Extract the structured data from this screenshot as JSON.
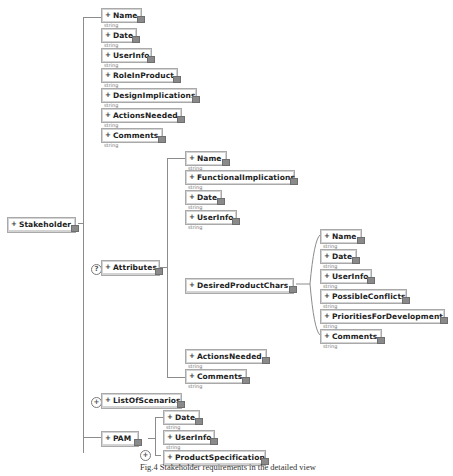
{
  "diagram": {
    "root": {
      "label": "Stakeholder"
    },
    "stakeholder_children": [
      {
        "label": "Name",
        "type": "string"
      },
      {
        "label": "Date",
        "type": "string"
      },
      {
        "label": "UserInfo",
        "type": "string"
      },
      {
        "label": "RoleInProduct",
        "type": "string"
      },
      {
        "label": "DesignImplications",
        "type": "string"
      },
      {
        "label": "ActionsNeeded",
        "type": "string"
      },
      {
        "label": "Comments",
        "type": "string"
      }
    ],
    "attributes": {
      "label": "Attributes",
      "optional_marker": "?",
      "children": [
        {
          "label": "Name",
          "type": "string"
        },
        {
          "label": "FunctionalImplications",
          "type": "string"
        },
        {
          "label": "Date",
          "type": "string"
        },
        {
          "label": "UserInfo",
          "type": "string"
        },
        {
          "label": "ActionsNeeded",
          "type": "string"
        },
        {
          "label": "Comments",
          "type": "string"
        }
      ]
    },
    "desired_product_chars": {
      "label": "DesiredProductChars",
      "children": [
        {
          "label": "Name",
          "type": "string"
        },
        {
          "label": "Date",
          "type": "string"
        },
        {
          "label": "UserInfo",
          "type": "string"
        },
        {
          "label": "PossibleConflicts",
          "type": "string"
        },
        {
          "label": "PrioritiesForDevelopment",
          "type": "string"
        },
        {
          "label": "Comments",
          "type": "string"
        }
      ]
    },
    "list_of_scenarios": {
      "label": "ListOfScenarios",
      "marker": "+"
    },
    "pam": {
      "label": "PAM",
      "children": [
        {
          "label": "Date",
          "type": "string"
        },
        {
          "label": "UserInfo",
          "type": "string"
        },
        {
          "label": "ProductSpecification",
          "marker": "+"
        }
      ]
    },
    "element_marker": "+"
  },
  "caption": "Fig.4 Stakeholder requirements in the detailed view"
}
